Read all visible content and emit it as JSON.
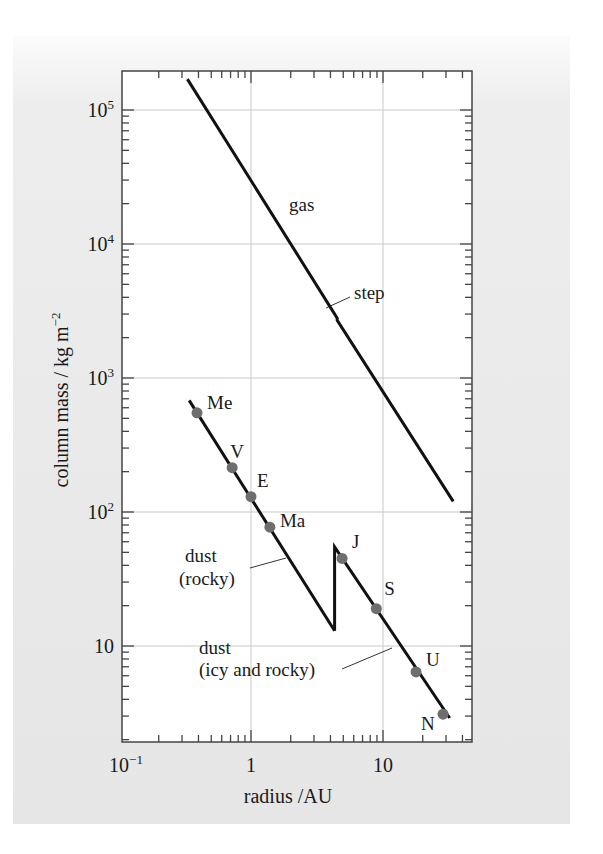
{
  "chart_data": {
    "type": "line",
    "title": "",
    "xlabel": "radius /AU",
    "ylabel": "column mass / kg m⁻²",
    "xscale": "log",
    "yscale": "log",
    "xlim": [
      0.1,
      47
    ],
    "ylim": [
      1.95,
      195000
    ],
    "grid": true,
    "legend": "none",
    "x_ticks": [
      {
        "value": 0.1,
        "label_base": "10",
        "label_exp": "−1"
      },
      {
        "value": 1,
        "label_base": "1",
        "label_exp": ""
      },
      {
        "value": 10,
        "label_base": "10",
        "label_exp": ""
      }
    ],
    "y_ticks": [
      {
        "value": 10,
        "label_base": "10",
        "label_exp": ""
      },
      {
        "value": 100,
        "label_base": "10",
        "label_exp": "2"
      },
      {
        "value": 1000,
        "label_base": "10",
        "label_exp": "3"
      },
      {
        "value": 10000,
        "label_base": "10",
        "label_exp": "4"
      },
      {
        "value": 100000,
        "label_base": "10",
        "label_exp": "5"
      }
    ],
    "series": [
      {
        "name": "gas",
        "points": [
          [
            0.33,
            170000
          ],
          [
            4.5,
            2800
          ],
          [
            4.5,
            2700
          ],
          [
            34,
            120
          ]
        ],
        "annotation": {
          "text": "gas",
          "at": [
            2.2,
            19000
          ]
        },
        "step_annotation": {
          "text": "step",
          "at": [
            4.5,
            2800
          ]
        }
      },
      {
        "name": "dust (rocky)",
        "points": [
          [
            0.34,
            680
          ],
          [
            4.3,
            13
          ]
        ],
        "annotation": {
          "text": [
            "dust",
            "(rocky)"
          ]
        }
      },
      {
        "name": "dust (icy and rocky)",
        "points": [
          [
            4.3,
            13
          ],
          [
            4.3,
            55
          ],
          [
            32,
            2.9
          ]
        ],
        "annotation": {
          "text": [
            "dust",
            "(icy and rocky)"
          ]
        }
      }
    ],
    "planets": [
      {
        "label": "Me",
        "x": 0.39,
        "y": 550
      },
      {
        "label": "V",
        "x": 0.72,
        "y": 214
      },
      {
        "label": "E",
        "x": 1.0,
        "y": 130
      },
      {
        "label": "Ma",
        "x": 1.39,
        "y": 77
      },
      {
        "label": "J",
        "x": 4.9,
        "y": 45
      },
      {
        "label": "S",
        "x": 8.9,
        "y": 19
      },
      {
        "label": "U",
        "x": 17.8,
        "y": 6.4
      },
      {
        "label": "N",
        "x": 28.5,
        "y": 3.1
      }
    ],
    "colors": {
      "line": "#111111",
      "point": "#6e6e6e",
      "grid": "#c8c8c8",
      "frame": "#444444"
    }
  },
  "axes": {
    "xlabel": "radius /AU",
    "ylabel_main": "column mass / kg m",
    "ylabel_exp": "−2"
  },
  "labels": {
    "gas": "gas",
    "step": "step",
    "dust_rocky_1": "dust",
    "dust_rocky_2": "(rocky)",
    "dust_icy_1": "dust",
    "dust_icy_2": "(icy and rocky)"
  }
}
